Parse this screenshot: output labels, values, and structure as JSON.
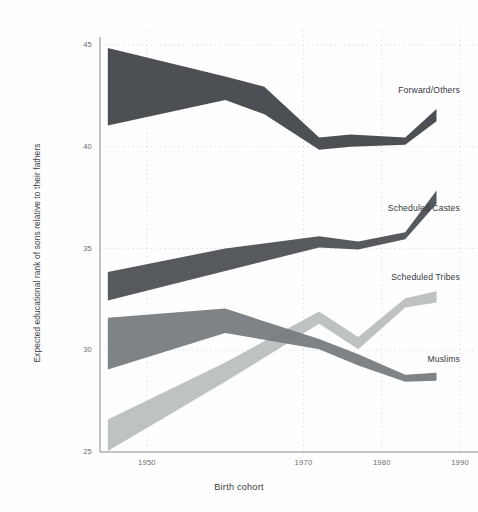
{
  "chart_data": {
    "type": "area",
    "title": "",
    "subtitle": "",
    "xlabel": "Birth cohort",
    "ylabel": "Expected educational rank of sons relative to their fathers",
    "xlim": [
      1944,
      1990
    ],
    "ylim": [
      25,
      45
    ],
    "xticks": [
      1950,
      1970,
      1980,
      1990
    ],
    "xticklabels": [
      "1950",
      "1970",
      "1980",
      "1990"
    ],
    "yticks": [
      25,
      30,
      35,
      40,
      45
    ],
    "yticklabels": [
      "25",
      "30",
      "35",
      "40",
      "45"
    ],
    "grid": true,
    "grid_style": "dotted",
    "legend_position": "inline-right",
    "band_note": "Each series is drawn as a confidence band (lower/upper) rather than a single line",
    "series": [
      {
        "name": "Forward/Others",
        "color": "#3e4247",
        "label_x": 1990,
        "label_y": 42.75,
        "x": [
          1945,
          1960,
          1965,
          1972,
          1976,
          1983,
          1987
        ],
        "upper": [
          44.85,
          43.45,
          42.95,
          40.45,
          40.6,
          40.45,
          41.85
        ],
        "lower": [
          41.05,
          42.3,
          41.6,
          39.85,
          40.0,
          40.1,
          41.25
        ],
        "center": [
          42.95,
          42.88,
          42.28,
          40.15,
          40.3,
          40.28,
          41.55
        ]
      },
      {
        "name": "Scheduled Castes",
        "color": "#494d52",
        "label_x": 1990,
        "label_y": 36.95,
        "x": [
          1945,
          1960,
          1972,
          1977,
          1983,
          1987
        ],
        "upper": [
          33.85,
          35.0,
          35.6,
          35.35,
          35.8,
          37.85
        ],
        "lower": [
          32.45,
          33.9,
          35.05,
          34.95,
          35.45,
          37.2
        ],
        "center": [
          33.15,
          34.45,
          35.32,
          35.15,
          35.62,
          37.52
        ]
      },
      {
        "name": "Scheduled Tribes",
        "color": "#b9bdbd",
        "label_x": 1990,
        "label_y": 33.55,
        "x": [
          1945,
          1960,
          1972,
          1977,
          1983,
          1987
        ],
        "upper": [
          26.6,
          29.4,
          31.9,
          30.65,
          32.55,
          32.9
        ],
        "lower": [
          25.05,
          28.45,
          31.3,
          30.05,
          32.1,
          32.35
        ],
        "center": [
          25.8,
          28.92,
          31.6,
          30.35,
          32.32,
          32.62
        ]
      },
      {
        "name": "Muslims",
        "color": "#737a7e",
        "label_x": 1990,
        "label_y": 29.5,
        "x": [
          1945,
          1960,
          1972,
          1977,
          1983,
          1987
        ],
        "upper": [
          31.6,
          32.05,
          30.55,
          29.8,
          28.8,
          28.9
        ],
        "lower": [
          29.05,
          30.85,
          30.05,
          29.25,
          28.45,
          28.5
        ],
        "center": [
          30.3,
          31.45,
          30.3,
          29.52,
          28.62,
          28.7
        ]
      }
    ]
  },
  "axes": {
    "y_axis_title": "Expected educational rank of sons relative to their fathers",
    "x_axis_title": "Birth cohort"
  },
  "colors": {
    "background": "#fefefe",
    "axis": "#8a8a8a",
    "grid": "#d6d6d6",
    "text": "#3d3d3d",
    "tick_text": "#6b6b6b"
  }
}
